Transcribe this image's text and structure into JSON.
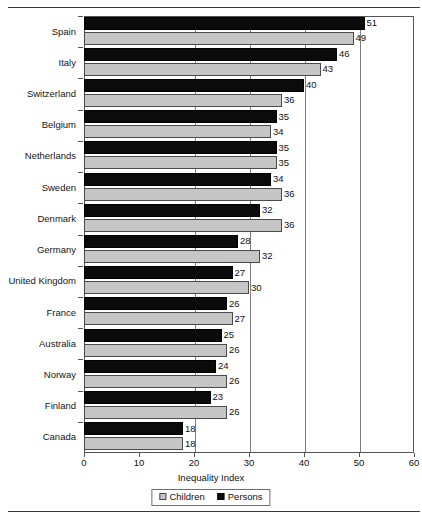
{
  "chart_data": {
    "type": "bar",
    "orientation": "horizontal",
    "title": "",
    "xlabel": "Inequality Index",
    "ylabel": "",
    "xlim": [
      0,
      60
    ],
    "xticks": [
      0,
      10,
      20,
      30,
      40,
      50,
      60
    ],
    "gridlines": [
      20,
      30,
      40,
      50
    ],
    "grid": true,
    "legend_position": "bottom",
    "categories": [
      "Spain",
      "Italy",
      "Switzerland",
      "Belgium",
      "Netherlands",
      "Sweden",
      "Denmark",
      "Germany",
      "United Kingdom",
      "France",
      "Australia",
      "Norway",
      "Finland",
      "Canada"
    ],
    "series": [
      {
        "name": "Persons",
        "color": "#0b0b0b",
        "values": [
          51,
          46,
          40,
          35,
          35,
          34,
          32,
          28,
          27,
          26,
          25,
          24,
          23,
          18
        ]
      },
      {
        "name": "Children",
        "color": "#c6c6c6",
        "values": [
          49,
          43,
          36,
          34,
          35,
          36,
          36,
          32,
          30,
          27,
          26,
          26,
          26,
          18
        ]
      }
    ]
  },
  "legend": {
    "entries": [
      {
        "label": "Children",
        "swatch": "children"
      },
      {
        "label": "Persons",
        "swatch": "persons"
      }
    ]
  },
  "axis": {
    "title": "Inequality Index"
  }
}
